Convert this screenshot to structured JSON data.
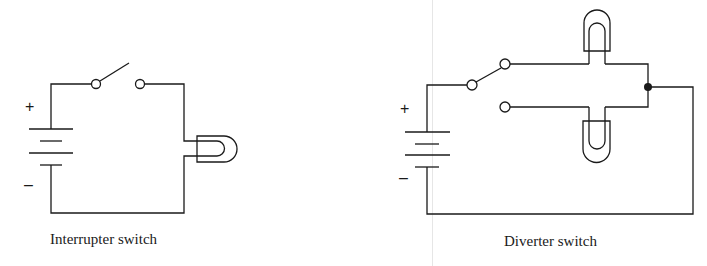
{
  "diagrams": [
    {
      "id": "interrupter",
      "caption": "Interrupter switch",
      "battery": {
        "plus": "+",
        "minus": "–"
      },
      "components": [
        "battery",
        "single-pole switch (open)",
        "lamp"
      ]
    },
    {
      "id": "diverter",
      "caption": "Diverter switch",
      "battery": {
        "plus": "+",
        "minus": "–"
      },
      "components": [
        "battery",
        "two-way switch",
        "upper lamp",
        "lower lamp",
        "junction"
      ]
    }
  ],
  "colors": {
    "line": "#1a1a1a",
    "background": "#ffffff"
  }
}
